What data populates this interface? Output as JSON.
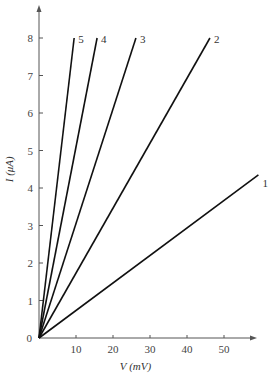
{
  "chart_data": {
    "type": "line",
    "title": "",
    "xlabel": "V (mV)",
    "ylabel": "I (μA)",
    "xlim": [
      0,
      58
    ],
    "ylim": [
      0,
      8.5
    ],
    "x_ticks": [
      10,
      20,
      30,
      40,
      50
    ],
    "y_ticks": [
      0,
      1,
      2,
      3,
      4,
      5,
      6,
      7,
      8
    ],
    "origin_label": "0",
    "grid": false,
    "legend": "inline labels at line ends",
    "series": [
      {
        "name": "1",
        "points": [
          [
            0,
            0
          ],
          [
            59.3,
            4.35
          ]
        ]
      },
      {
        "name": "2",
        "points": [
          [
            0,
            0
          ],
          [
            46.2,
            8
          ]
        ]
      },
      {
        "name": "3",
        "points": [
          [
            0,
            0
          ],
          [
            26.2,
            8
          ]
        ]
      },
      {
        "name": "4",
        "points": [
          [
            0,
            0
          ],
          [
            15.7,
            8
          ]
        ]
      },
      {
        "name": "5",
        "points": [
          [
            0,
            0
          ],
          [
            9.5,
            8
          ]
        ]
      }
    ]
  },
  "plot_area": {
    "x0": 39,
    "y0": 338,
    "px_per_x": 3.7,
    "px_per_y": 37.5,
    "x_axis_end": 252,
    "y_axis_top": 8
  },
  "colors": {
    "axis": "#555555",
    "line": "#111111",
    "text": "#444444"
  }
}
